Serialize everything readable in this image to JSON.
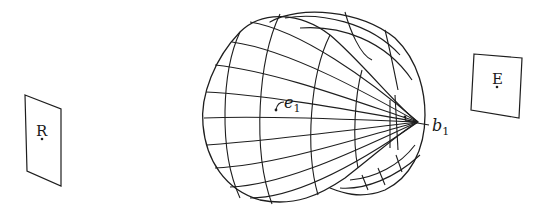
{
  "diagram": {
    "type": "3D surface with two planes",
    "left_plane": {
      "label": "R"
    },
    "right_plane": {
      "label": "E"
    },
    "surface": {
      "description": "lobed balloon-shaped mesh surface converging to an apex point",
      "points": [
        {
          "label": "e",
          "subscript": "1"
        },
        {
          "label": "b",
          "subscript": "1"
        }
      ]
    }
  }
}
